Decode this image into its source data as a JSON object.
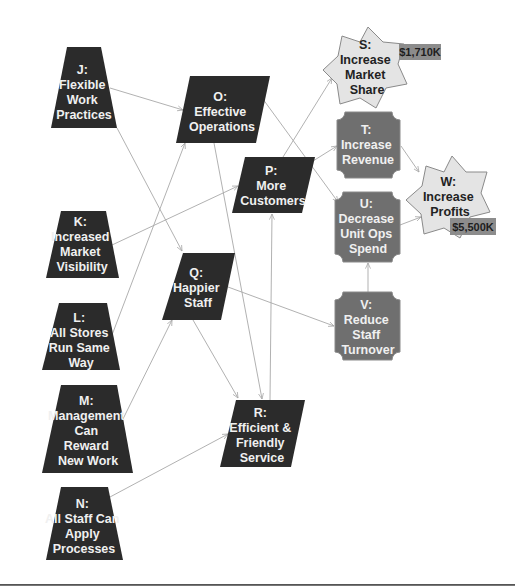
{
  "colors": {
    "dark_node": "#2b2b2b",
    "grey_node": "#6f6f6f",
    "star_fill": "#e4e4e4",
    "star_stroke": "#8a8a8a",
    "badge_fill": "#8c8c8c",
    "edge": "#a8a8a8"
  },
  "nodes": {
    "J": {
      "label": [
        "J:",
        "Flexible",
        "Work",
        "Practices"
      ],
      "shape": "trapezoid"
    },
    "K": {
      "label": [
        "K:",
        "Increased",
        "Market",
        "Visibility"
      ],
      "shape": "trapezoid"
    },
    "L": {
      "label": [
        "L:",
        "All Stores",
        "Run Same",
        "Way"
      ],
      "shape": "trapezoid"
    },
    "M": {
      "label": [
        "M:",
        "Management",
        "Can",
        "Reward",
        "New Work"
      ],
      "shape": "trapezoid"
    },
    "N": {
      "label": [
        "N:",
        "All Staff Can",
        "Apply",
        "Processes"
      ],
      "shape": "trapezoid"
    },
    "O": {
      "label": [
        "O:",
        "Effective",
        "Operations"
      ],
      "shape": "parallelogram"
    },
    "P": {
      "label": [
        "P:",
        "More",
        "Customers"
      ],
      "shape": "parallelogram"
    },
    "Q": {
      "label": [
        "Q:",
        "Happier",
        "Staff"
      ],
      "shape": "parallelogram"
    },
    "R": {
      "label": [
        "R:",
        "Efficient &",
        "Friendly",
        "Service"
      ],
      "shape": "parallelogram"
    },
    "S": {
      "label": [
        "S:",
        "Increase",
        "Market",
        "Share"
      ],
      "shape": "star",
      "badge": "$1,710K"
    },
    "T": {
      "label": [
        "T:",
        "Increase",
        "Revenue"
      ],
      "shape": "bevel-rect"
    },
    "U": {
      "label": [
        "U:",
        "Decrease",
        "Unit Ops",
        "Spend"
      ],
      "shape": "bevel-rect"
    },
    "V": {
      "label": [
        "V:",
        "Reduce",
        "Staff",
        "Turnover"
      ],
      "shape": "bevel-rect"
    },
    "W": {
      "label": [
        "W:",
        "Increase",
        "Profits"
      ],
      "shape": "star",
      "badge": "$5,500K"
    }
  },
  "edges": [
    [
      "J",
      "O"
    ],
    [
      "J",
      "Q"
    ],
    [
      "K",
      "P"
    ],
    [
      "L",
      "O"
    ],
    [
      "M",
      "Q"
    ],
    [
      "N",
      "R"
    ],
    [
      "O",
      "U"
    ],
    [
      "O",
      "R"
    ],
    [
      "P",
      "S"
    ],
    [
      "P",
      "T"
    ],
    [
      "Q",
      "V"
    ],
    [
      "Q",
      "R"
    ],
    [
      "R",
      "P"
    ],
    [
      "T",
      "W"
    ],
    [
      "U",
      "W"
    ],
    [
      "V",
      "U"
    ]
  ]
}
